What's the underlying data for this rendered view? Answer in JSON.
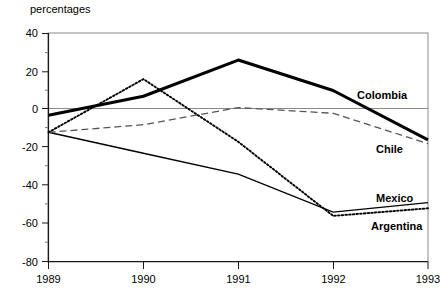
{
  "chart_data": {
    "type": "line",
    "title": "percentages",
    "xlabel": "",
    "ylabel": "",
    "x": [
      1989,
      1990,
      1991,
      1992,
      1993
    ],
    "xtick_labels": [
      "1989",
      "1990",
      "1991",
      "1992",
      "1993"
    ],
    "ytick_labels": [
      "40",
      "20",
      "0",
      "-20",
      "-40",
      "-60",
      "-80"
    ],
    "yticks": [
      40,
      20,
      0,
      -20,
      -40,
      -60,
      -80
    ],
    "xlim": [
      1989,
      1993
    ],
    "ylim": [
      -80,
      40
    ],
    "grid": false,
    "minor_ticks": true,
    "zero_line": true,
    "legend": "inline-end-labels",
    "series": [
      {
        "name": "Colombia",
        "style": "solid-thick",
        "color": "#000000",
        "values": [
          -3,
          7,
          26,
          10,
          -16
        ]
      },
      {
        "name": "Chile",
        "style": "dashed",
        "color": "#555555",
        "values": [
          -12,
          -8,
          1,
          -2,
          -18
        ]
      },
      {
        "name": "Mexico",
        "style": "solid-thin",
        "color": "#000000",
        "values": [
          -12,
          -23,
          -34,
          -54,
          -49
        ]
      },
      {
        "name": "Argentina",
        "style": "dotted",
        "color": "#000000",
        "values": [
          -12,
          16,
          -17,
          -56,
          -52
        ]
      }
    ]
  },
  "axis": {
    "y_label_40": "40",
    "y_label_20": "20",
    "y_label_0": "0",
    "y_label_m20": "-20",
    "y_label_m40": "-40",
    "y_label_m60": "-60",
    "y_label_m80": "-80",
    "x_label_1989": "1989",
    "x_label_1990": "1990",
    "x_label_1991": "1991",
    "x_label_1992": "1992",
    "x_label_1993": "1993"
  },
  "labels": {
    "colombia": "Colombia",
    "chile": "Chile",
    "mexico": "Mexico",
    "argentina": "Argentina"
  }
}
